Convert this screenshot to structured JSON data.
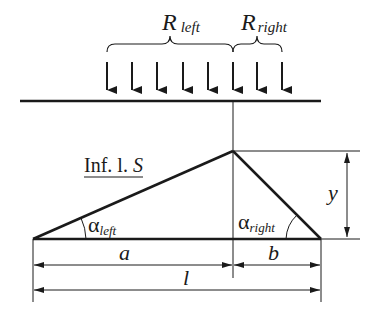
{
  "diagram": {
    "labels": {
      "r_left_main": "R",
      "r_left_sub": "left",
      "r_right_main": "R",
      "r_right_sub": "right",
      "influence_line": "Inf. l. ",
      "influence_line_var": "S",
      "alpha_left_main": "α",
      "alpha_left_sub": "left",
      "alpha_right_main": "α",
      "alpha_right_sub": "right",
      "dim_a": "a",
      "dim_b": "b",
      "dim_l": "l",
      "dim_y": "y"
    },
    "load_arrows_count": 8,
    "colors": {
      "line": "#1a1a1a",
      "background": "#ffffff"
    }
  }
}
